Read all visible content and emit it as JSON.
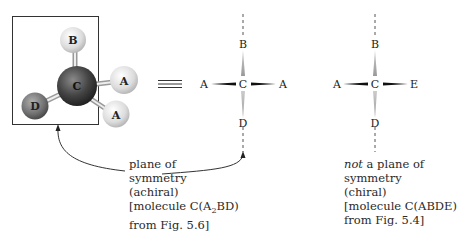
{
  "model": {
    "atoms": [
      {
        "id": "B",
        "label": "B"
      },
      {
        "id": "C",
        "label": "C"
      },
      {
        "id": "A1",
        "label": "A"
      },
      {
        "id": "A2",
        "label": "A"
      },
      {
        "id": "D",
        "label": "D"
      }
    ]
  },
  "equivalence_symbol": "≡",
  "projection_achiral": {
    "top": "B",
    "center": "C",
    "left": "A",
    "right": "A",
    "bottom": "D"
  },
  "projection_chiral": {
    "top": "B",
    "center": "C",
    "left": "A",
    "right": "E",
    "bottom": "D"
  },
  "caption_achiral": {
    "line1": "plane of",
    "line2": "symmetry",
    "line3": "(achiral)",
    "line4_pre": "[molecule C(A",
    "line4_sub": "2",
    "line4_post": "BD)",
    "line5": "from Fig. 5.6]"
  },
  "caption_chiral": {
    "line1_em": "not",
    "line1_rest": " a plane of",
    "line2": "symmetry",
    "line3": "(chiral)",
    "line4": "[molecule C(ABDE)",
    "line5": "from Fig. 5.4]"
  }
}
